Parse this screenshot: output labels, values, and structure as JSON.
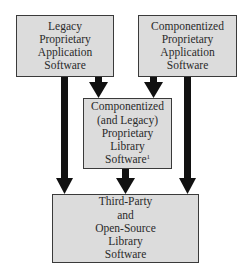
{
  "diagram": {
    "type": "dependency-flow",
    "nodes": [
      {
        "id": "legacy_app",
        "lines": [
          "Legacy",
          "Proprietary",
          "Application",
          "Software"
        ]
      },
      {
        "id": "componentized_app",
        "lines": [
          "Componentized",
          "Proprietary",
          "Application",
          "Software"
        ]
      },
      {
        "id": "proprietary_lib",
        "lines": [
          "Componentized",
          "(and Legacy)",
          "Proprietary",
          "Library",
          "Software"
        ],
        "footnote": "1"
      },
      {
        "id": "third_party_lib",
        "lines": [
          "Third-Party",
          "and",
          "Open-Source",
          "Library",
          "Software"
        ]
      }
    ],
    "edges": [
      {
        "from": "legacy_app",
        "to": "proprietary_lib"
      },
      {
        "from": "legacy_app",
        "to": "third_party_lib"
      },
      {
        "from": "componentized_app",
        "to": "proprietary_lib"
      },
      {
        "from": "componentized_app",
        "to": "third_party_lib"
      },
      {
        "from": "proprietary_lib",
        "to": "third_party_lib"
      }
    ],
    "colors": {
      "box_fill": "#dcdcdc",
      "box_border": "#3a3a3a",
      "arrow": "#111111",
      "text": "#2a2a2a"
    }
  }
}
